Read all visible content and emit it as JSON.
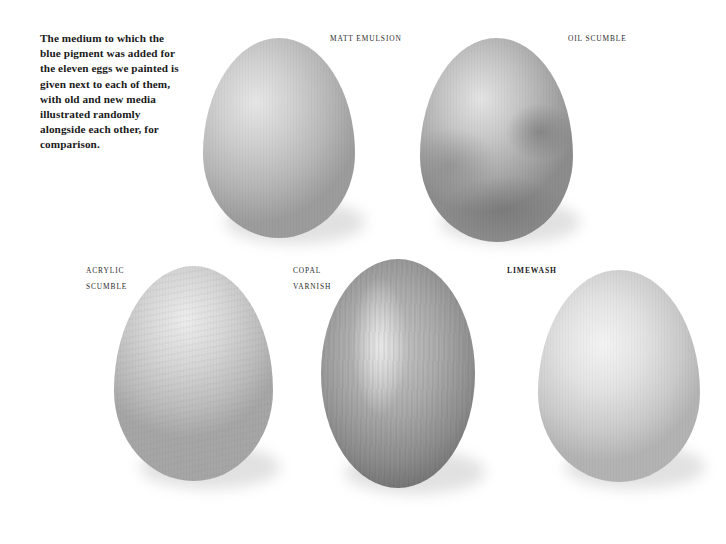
{
  "intro_text": "The medium to which the blue pigment was added for the eleven eggs we painted is given next to each of them, with old and new media illustrated randomly alongside each other, for comparison.",
  "eggs": [
    {
      "label_lines": [
        "MATT EMULSION"
      ],
      "finish": "matt-emulsion",
      "tone": "#b9b9b9"
    },
    {
      "label_lines": [
        "OIL SCUMBLE"
      ],
      "finish": "oil-scumble",
      "tone": "#a6a6a6"
    },
    {
      "label_lines": [
        "ACRYLIC",
        "SCUMBLE"
      ],
      "finish": "acrylic-scumble",
      "tone": "#c4c4c4"
    },
    {
      "label_lines": [
        "COPAL",
        "VARNISH"
      ],
      "finish": "copal-varnish",
      "tone": "#9a9a9a"
    },
    {
      "label_lines": [
        "LIMEWASH"
      ],
      "finish": "limewash",
      "tone": "#d3d3d3"
    }
  ]
}
